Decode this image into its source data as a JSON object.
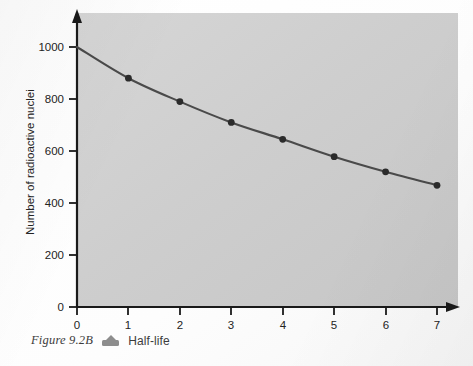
{
  "figure": {
    "caption_number": "Figure 9.2B",
    "caption_marker_icon": "up-triangle-marker-icon",
    "caption_title": "Half-life"
  },
  "chart_data": {
    "type": "line",
    "title": "",
    "subtitle": "",
    "xlabel": "",
    "ylabel": "Number of radioactive nuclei",
    "x": [
      0,
      1,
      2,
      3,
      4,
      5,
      6,
      7
    ],
    "values": [
      1000,
      880,
      790,
      710,
      645,
      578,
      520,
      468
    ],
    "series": [
      {
        "name": "Number of radioactive nuclei",
        "x": [
          0,
          1,
          2,
          3,
          4,
          5,
          6,
          7
        ],
        "values": [
          1000,
          880,
          790,
          710,
          645,
          578,
          520,
          468
        ]
      }
    ],
    "xlim": [
      0,
      7.4
    ],
    "ylim": [
      0,
      1080
    ],
    "xticks": [
      0,
      1,
      2,
      3,
      4,
      5,
      6,
      7
    ],
    "xtick_labels": [
      "0",
      "1",
      "2",
      "3",
      "4",
      "5",
      "6",
      "7"
    ],
    "yticks": [
      0,
      200,
      400,
      600,
      800,
      1000
    ],
    "ytick_labels": [
      "0",
      "200",
      "400",
      "600",
      "800",
      "1000"
    ],
    "grid": false,
    "legend": false,
    "legend_position": "none",
    "markers": "filled-circle",
    "marker_points_shown": [
      1,
      2,
      3,
      4,
      5,
      6,
      7
    ],
    "axis_arrows": true,
    "plot_background": "#cfcfcf",
    "line_color": "#4a4a4a",
    "marker_color": "#2b2b2b",
    "axis_color": "#1a1a1a"
  }
}
